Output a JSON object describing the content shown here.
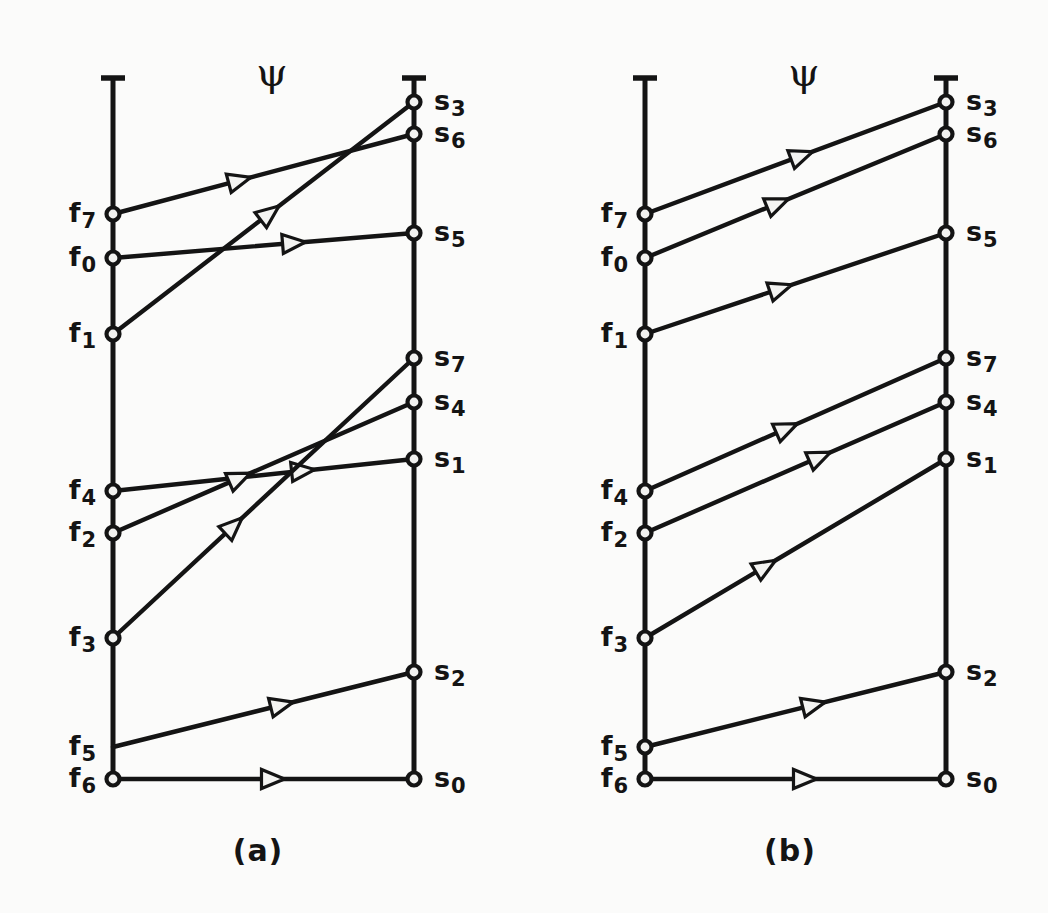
{
  "figure": {
    "background": "#fbfbfa",
    "ink_color": "#141414",
    "psi_symbol": "ψ",
    "panels": [
      {
        "id": "a",
        "caption": "(a)",
        "psi_label": "ψ",
        "left_labels": [
          {
            "name": "f7",
            "base": "f",
            "sub": "7"
          },
          {
            "name": "f0",
            "base": "f",
            "sub": "0"
          },
          {
            "name": "f1",
            "base": "f",
            "sub": "1"
          },
          {
            "name": "f4",
            "base": "f",
            "sub": "4"
          },
          {
            "name": "f2",
            "base": "f",
            "sub": "2"
          },
          {
            "name": "f3",
            "base": "f",
            "sub": "3"
          },
          {
            "name": "f5",
            "base": "f",
            "sub": "5"
          },
          {
            "name": "f6",
            "base": "f",
            "sub": "6"
          }
        ],
        "right_labels": [
          {
            "name": "s3",
            "base": "s",
            "sub": "3"
          },
          {
            "name": "s6",
            "base": "s",
            "sub": "6"
          },
          {
            "name": "s5",
            "base": "s",
            "sub": "5"
          },
          {
            "name": "s7",
            "base": "s",
            "sub": "7"
          },
          {
            "name": "s4",
            "base": "s",
            "sub": "4"
          },
          {
            "name": "s1",
            "base": "s",
            "sub": "1"
          },
          {
            "name": "s2",
            "base": "s",
            "sub": "2"
          },
          {
            "name": "s0",
            "base": "s",
            "sub": "0"
          }
        ],
        "mapping": [
          {
            "from": "f7",
            "to": "s6"
          },
          {
            "from": "f0",
            "to": "s5"
          },
          {
            "from": "f1",
            "to": "s3"
          },
          {
            "from": "f4",
            "to": "s1"
          },
          {
            "from": "f2",
            "to": "s4"
          },
          {
            "from": "f3",
            "to": "s7"
          },
          {
            "from": "f5",
            "to": "s2"
          },
          {
            "from": "f6",
            "to": "s0"
          }
        ]
      },
      {
        "id": "b",
        "caption": "(b)",
        "psi_label": "ψ",
        "left_labels": [
          {
            "name": "f7",
            "base": "f",
            "sub": "7"
          },
          {
            "name": "f0",
            "base": "f",
            "sub": "0"
          },
          {
            "name": "f1",
            "base": "f",
            "sub": "1"
          },
          {
            "name": "f4",
            "base": "f",
            "sub": "4"
          },
          {
            "name": "f2",
            "base": "f",
            "sub": "2"
          },
          {
            "name": "f3",
            "base": "f",
            "sub": "3"
          },
          {
            "name": "f5",
            "base": "f",
            "sub": "5"
          },
          {
            "name": "f6",
            "base": "f",
            "sub": "6"
          }
        ],
        "right_labels": [
          {
            "name": "s3",
            "base": "s",
            "sub": "3"
          },
          {
            "name": "s6",
            "base": "s",
            "sub": "6"
          },
          {
            "name": "s5",
            "base": "s",
            "sub": "5"
          },
          {
            "name": "s7",
            "base": "s",
            "sub": "7"
          },
          {
            "name": "s4",
            "base": "s",
            "sub": "4"
          },
          {
            "name": "s1",
            "base": "s",
            "sub": "1"
          },
          {
            "name": "s2",
            "base": "s",
            "sub": "2"
          },
          {
            "name": "s0",
            "base": "s",
            "sub": "0"
          }
        ],
        "mapping": [
          {
            "from": "f7",
            "to": "s3"
          },
          {
            "from": "f0",
            "to": "s6"
          },
          {
            "from": "f1",
            "to": "s5"
          },
          {
            "from": "f4",
            "to": "s7"
          },
          {
            "from": "f2",
            "to": "s4"
          },
          {
            "from": "f3",
            "to": "s1"
          },
          {
            "from": "f5",
            "to": "s2"
          },
          {
            "from": "f6",
            "to": "s0"
          }
        ]
      }
    ]
  },
  "geometry": {
    "panel_a": {
      "left_x": 113,
      "right_x": 414,
      "axis_top": 78,
      "axis_bottom": 781,
      "caption_x": 258,
      "caption_y": 833,
      "psi_x": 272,
      "psi_y": 72
    },
    "panel_b": {
      "left_x": 645,
      "right_x": 946,
      "axis_top": 78,
      "axis_bottom": 781,
      "caption_x": 790,
      "caption_y": 833,
      "psi_x": 804,
      "psi_y": 72
    },
    "left_y": {
      "f7": 214,
      "f0": 258,
      "f1": 334,
      "f4": 491,
      "f2": 533,
      "f3": 638,
      "f5": 747,
      "f6": 779
    },
    "right_y": {
      "s3": 102,
      "s6": 134,
      "s5": 233,
      "s7": 358,
      "s4": 402,
      "s1": 459,
      "s2": 672,
      "s0": 779
    },
    "left_label_offset": -18,
    "right_label_offset": 20,
    "no_dot": {
      "panel_a_left": [
        "f5"
      ]
    },
    "arrow_t": {
      "a": {
        "f7": 0.42,
        "f0": 0.6,
        "f1": 0.52,
        "f4": 0.63,
        "f2": 0.42,
        "f3": 0.4,
        "f5": 0.56,
        "f6": 0.53
      },
      "b": {
        "f7": 0.52,
        "f0": 0.44,
        "f1": 0.45,
        "f4": 0.47,
        "f2": 0.58,
        "f3": 0.4,
        "f5": 0.56,
        "f6": 0.53
      }
    }
  }
}
